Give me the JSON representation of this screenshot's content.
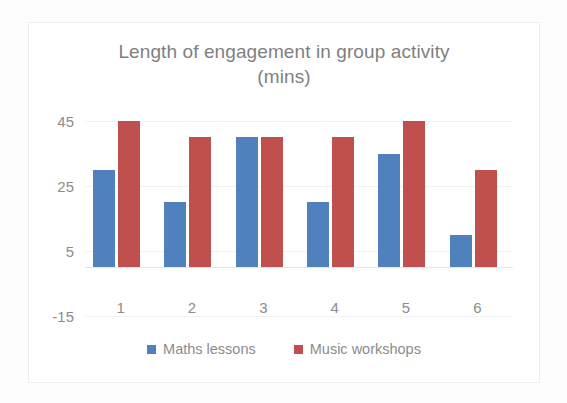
{
  "chart_data": {
    "type": "bar",
    "title": "Length of engagement in group activity (mins)",
    "title_line1": "Length of engagement in group activity",
    "title_line2": "(mins)",
    "xlabel": "",
    "ylabel": "",
    "categories": [
      "1",
      "2",
      "3",
      "4",
      "5",
      "6"
    ],
    "series": [
      {
        "name": "Maths lessons",
        "color": "#4f81bd",
        "values": [
          30,
          20,
          40,
          20,
          35,
          10
        ]
      },
      {
        "name": "Music workshops",
        "color": "#c0504d",
        "values": [
          45,
          40,
          40,
          40,
          45,
          30
        ]
      }
    ],
    "ylim": [
      -15,
      45
    ],
    "yticks": [
      "45",
      "25",
      "5",
      "-15"
    ],
    "ytick_values": [
      45,
      25,
      5,
      -15
    ],
    "grid": true,
    "grid_color": "#f2f2f2",
    "legend_position": "bottom",
    "plot_background": "#ffffff",
    "text_color": "#8c8c8c",
    "border_color": "#eceff1"
  }
}
